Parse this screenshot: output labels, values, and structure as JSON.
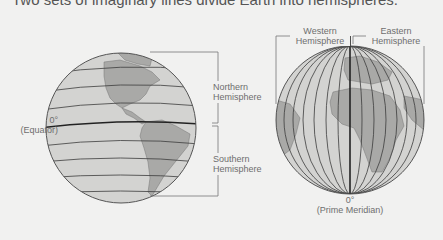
{
  "title": "Two sets of imaginary lines divide Earth into hemispheres.",
  "colors": {
    "background": "#f1f1f0",
    "ocean": "#d3d3d1",
    "land": "#a9a9a7",
    "grid_line": "#3c3c3c",
    "label_text": "#6e6e6e"
  },
  "left_globe": {
    "view": "Americas",
    "line_type": "parallels",
    "labels": {
      "equator_deg": "0°",
      "equator_name": "(Equator)",
      "north_1": "Northern",
      "north_2": "Hemisphere",
      "south_1": "Southern",
      "south_2": "Hemisphere"
    }
  },
  "right_globe": {
    "view": "Europe and Africa",
    "line_type": "meridians",
    "labels": {
      "west_1": "Western",
      "west_2": "Hemisphere",
      "east_1": "Eastern",
      "east_2": "Hemisphere",
      "meridian_deg": "0°",
      "meridian_name": "(Prime Meridian)"
    }
  }
}
